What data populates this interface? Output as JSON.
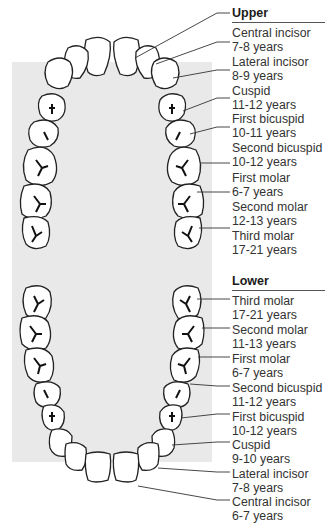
{
  "upper": {
    "title": "Upper",
    "teeth": [
      {
        "name": "Central incisor",
        "age": "7-8 years"
      },
      {
        "name": "Lateral incisor",
        "age": "8-9 years"
      },
      {
        "name": "Cuspid",
        "age": "11-12 years"
      },
      {
        "name": "First bicuspid",
        "age": "10-11 years"
      },
      {
        "name": "Second bicuspid",
        "age": "10-12 years"
      },
      {
        "name": "First molar",
        "age": "6-7 years"
      },
      {
        "name": "Second molar",
        "age": "12-13 years"
      },
      {
        "name": "Third molar",
        "age": "17-21 years"
      }
    ]
  },
  "lower": {
    "title": "Lower",
    "teeth": [
      {
        "name": "Third molar",
        "age": "17-21 years"
      },
      {
        "name": "Second molar",
        "age": "11-13 years"
      },
      {
        "name": "First molar",
        "age": "6-7 years"
      },
      {
        "name": "Second bicuspid",
        "age": "11-12 years"
      },
      {
        "name": "First bicuspid",
        "age": "10-12 years"
      },
      {
        "name": "Cuspid",
        "age": "9-10 years"
      },
      {
        "name": "Lateral incisor",
        "age": "7-8 years"
      },
      {
        "name": "Central incisor",
        "age": "6-7 years"
      }
    ]
  },
  "colors": {
    "background_panel": "#e9e9e9",
    "tooth_fill": "#ffffff",
    "outline": "#222222"
  }
}
